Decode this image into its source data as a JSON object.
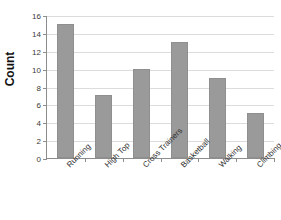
{
  "chart_data": {
    "type": "bar",
    "title": "",
    "xlabel": "",
    "ylabel": "Count",
    "categories": [
      "Running",
      "High Top",
      "Cross Trainers",
      "Basketball",
      "Walking",
      "Climbing"
    ],
    "values": [
      15,
      7,
      10,
      13,
      9,
      5
    ],
    "ylim": [
      0,
      16
    ],
    "ytick_labels": [
      "16",
      "14",
      "12",
      "10",
      "8",
      "6",
      "4",
      "2",
      "0"
    ],
    "ytick_values": [
      16,
      14,
      12,
      10,
      8,
      6,
      4,
      2,
      0
    ],
    "grid": "horizontal",
    "legend": "none",
    "bar_color": "#9a9a9a",
    "gridline_color": "#dcdcdc",
    "axis_color": "#8d8d8d"
  }
}
